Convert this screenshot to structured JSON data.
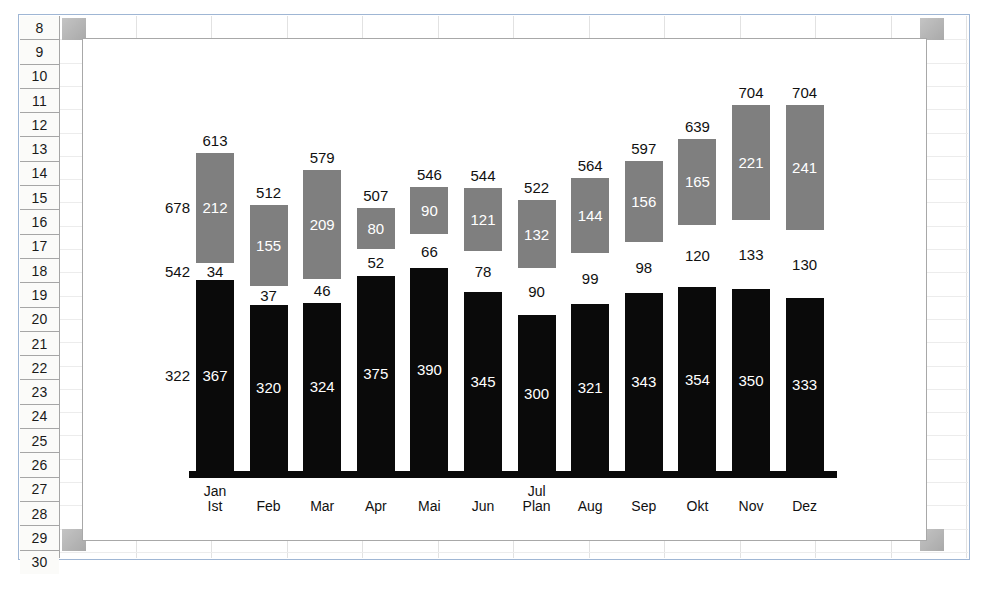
{
  "spreadsheet": {
    "row_headers": [
      "8",
      "9",
      "10",
      "11",
      "12",
      "13",
      "14",
      "15",
      "16",
      "17",
      "18",
      "19",
      "20",
      "21",
      "22",
      "23",
      "24",
      "25",
      "26",
      "27",
      "28",
      "29",
      "30"
    ]
  },
  "chart_data": {
    "type": "bar",
    "subtype": "stacked-column",
    "title": "",
    "xlabel": "",
    "ylabel": "",
    "categories": [
      "Jan\nIst",
      "Feb",
      "Mar",
      "Apr",
      "Mai",
      "Jun",
      "Jul\nPlan",
      "Aug",
      "Sep",
      "Okt",
      "Nov",
      "Dez"
    ],
    "category_lines": [
      [
        "Jan",
        "Ist"
      ],
      [
        "Feb",
        ""
      ],
      [
        "Mar",
        ""
      ],
      [
        "Apr",
        ""
      ],
      [
        "Mai",
        ""
      ],
      [
        "Jun",
        ""
      ],
      [
        "Jul",
        "Plan"
      ],
      [
        "Aug",
        ""
      ],
      [
        "Sep",
        ""
      ],
      [
        "Okt",
        ""
      ],
      [
        "Nov",
        ""
      ],
      [
        "Dez",
        ""
      ]
    ],
    "series": [
      {
        "name": "bottom",
        "color": "#0a0a0a",
        "values": [
          367,
          320,
          324,
          375,
          390,
          345,
          300,
          321,
          343,
          354,
          350,
          333
        ]
      },
      {
        "name": "middle",
        "color": "#ffffff",
        "values": [
          34,
          37,
          46,
          52,
          66,
          78,
          90,
          99,
          98,
          120,
          133,
          130
        ]
      },
      {
        "name": "top",
        "color": "#7f7f7f",
        "values": [
          212,
          155,
          209,
          80,
          90,
          121,
          132,
          144,
          156,
          165,
          221,
          241
        ]
      }
    ],
    "totals": [
      613,
      512,
      579,
      507,
      546,
      544,
      522,
      564,
      597,
      639,
      704,
      704
    ],
    "side_annotations": [
      {
        "label": "678",
        "series": "top"
      },
      {
        "label": "542",
        "series": "middle"
      },
      {
        "label": "322",
        "series": "bottom"
      }
    ],
    "grid": false,
    "legend": "none",
    "ylim": [
      0,
      760
    ]
  }
}
